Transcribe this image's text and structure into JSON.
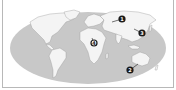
{
  "map": {
    "type": "world-map",
    "style": "grayscale",
    "colors": {
      "ocean": "#c8c8c8",
      "land": "#f4f4f4",
      "marker": "#1a1a1a",
      "marker_text": "#ffffff",
      "frame": "#b8b8b8"
    },
    "markers": [
      {
        "label": "1",
        "region": "Russia / Central Asia",
        "x": 122,
        "y": 19
      },
      {
        "label": "2",
        "region": "Southern Australia",
        "x": 130,
        "y": 70
      },
      {
        "label": "3",
        "region": "East Asia",
        "x": 142,
        "y": 33
      },
      {
        "label": "4",
        "region": "Central Africa",
        "x": 94,
        "y": 43
      }
    ]
  }
}
